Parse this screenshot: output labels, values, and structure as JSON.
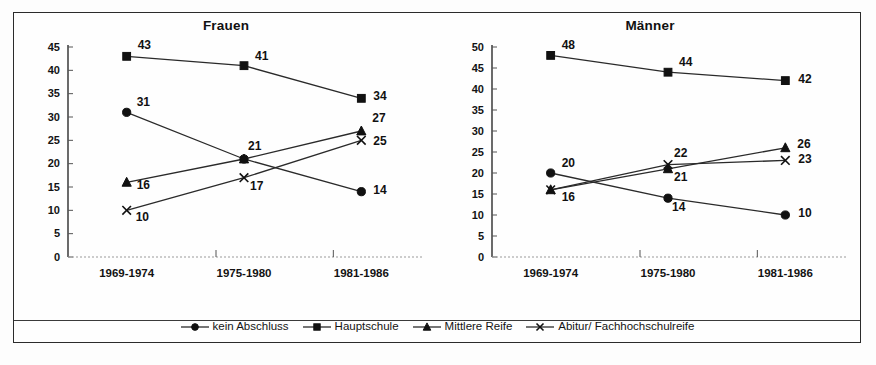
{
  "figure": {
    "panels": [
      {
        "title": "Frauen"
      },
      {
        "title": "Männer"
      }
    ],
    "legend": [
      {
        "label": "kein Abschluss",
        "marker": "circle-marker"
      },
      {
        "label": "Hauptschule",
        "marker": "square-marker"
      },
      {
        "label": "Mittlere Reife",
        "marker": "triangle-marker"
      },
      {
        "label": "Abitur/ Fachhochschulreife",
        "marker": "x-marker"
      }
    ]
  },
  "chart_data": [
    {
      "type": "line",
      "title": "Frauen",
      "xlabel": "",
      "ylabel": "",
      "categories": [
        "1969-1974",
        "1975-1980",
        "1981-1986"
      ],
      "ylim": [
        0,
        45
      ],
      "yticks": [
        0,
        5,
        10,
        15,
        20,
        25,
        30,
        35,
        40,
        45
      ],
      "grid": false,
      "legend_position": "bottom",
      "series": [
        {
          "name": "kein Abschluss",
          "marker": "circle",
          "values": [
            31,
            21,
            14
          ]
        },
        {
          "name": "Hauptschule",
          "marker": "square",
          "values": [
            43,
            41,
            34
          ]
        },
        {
          "name": "Mittlere Reife",
          "marker": "triangle",
          "values": [
            16,
            21,
            27
          ]
        },
        {
          "name": "Abitur/ Fachhochschulreife",
          "marker": "x",
          "values": [
            10,
            17,
            25
          ]
        }
      ]
    },
    {
      "type": "line",
      "title": "Männer",
      "xlabel": "",
      "ylabel": "",
      "categories": [
        "1969-1974",
        "1975-1980",
        "1981-1986"
      ],
      "ylim": [
        0,
        50
      ],
      "yticks": [
        0,
        5,
        10,
        15,
        20,
        25,
        30,
        35,
        40,
        45,
        50
      ],
      "grid": false,
      "legend_position": "bottom",
      "series": [
        {
          "name": "kein Abschluss",
          "marker": "circle",
          "values": [
            20,
            14,
            10
          ]
        },
        {
          "name": "Hauptschule",
          "marker": "square",
          "values": [
            48,
            44,
            42
          ]
        },
        {
          "name": "Mittlere Reife",
          "marker": "triangle",
          "values": [
            16,
            21,
            26
          ]
        },
        {
          "name": "Abitur/ Fachhochschulreife",
          "marker": "x",
          "values": [
            16,
            22,
            23
          ]
        }
      ]
    }
  ],
  "point_label_offsets": [
    {
      "kein Abschluss": [
        [
          10,
          -6
        ],
        [
          4,
          -9
        ],
        [
          12,
          2
        ]
      ],
      "Hauptschule": [
        [
          11,
          -7
        ],
        [
          11,
          -6
        ],
        [
          12,
          2
        ]
      ],
      "Mittlere Reife": [
        [
          10,
          7
        ],
        [
          0,
          0
        ],
        [
          11,
          -9
        ]
      ],
      "Abitur/ Fachhochschulreife": [
        [
          9,
          11
        ],
        [
          6,
          12
        ],
        [
          12,
          5
        ]
      ]
    },
    {
      "kein Abschluss": [
        [
          11,
          -6
        ],
        [
          4,
          13
        ],
        [
          13,
          2
        ]
      ],
      "Hauptschule": [
        [
          11,
          -6
        ],
        [
          11,
          -6
        ],
        [
          13,
          2
        ]
      ],
      "Mittlere Reife": [
        [
          11,
          11
        ],
        [
          6,
          12
        ],
        [
          12,
          0
        ]
      ],
      "Abitur/ Fachhochschulreife": [
        [
          0,
          0
        ],
        [
          6,
          -8
        ],
        [
          13,
          3
        ]
      ]
    }
  ]
}
